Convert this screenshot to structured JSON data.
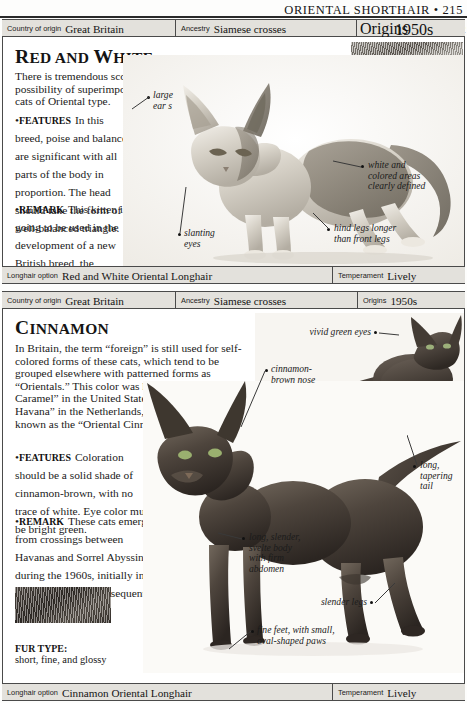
{
  "running_head": {
    "title": "ORIENTAL SHORTHAIR",
    "separator": "•",
    "page_number": "215",
    "full": "ORIENTAL SHORTHAIR • 215"
  },
  "entries": [
    {
      "id": "red-and-white",
      "title_first_letter": "R",
      "title_rest_1": "ED AND ",
      "title_letter_2": "W",
      "title_rest_2": "HITE",
      "title": "RED AND WHITE",
      "databar": {
        "country_label": "Country of origin",
        "country_value": "Great Britain",
        "ancestry_label": "Ancestry",
        "ancestry_value": "Siamese crosses",
        "origins_label": "Origins",
        "origins_value": "1950s"
      },
      "intro": "There is tremendous scope within the Oriental group, with the possibility of superimposing virtually any color or pattern onto cats of Oriental type.",
      "features_label": "FEATURES",
      "features_text": "In this breed, poise and balance are significant with all parts of the body in proportion. The head should take the form of a well-balanced triangle.",
      "remark_label": "REMARK",
      "remark_text": "This kitten is going to be used in the development of a new British breed, the Seychellois.",
      "fur_type_label": "FUR TYPE:",
      "fur_type_value": "short, fine, and glossy",
      "callouts": [
        {
          "name": "large-ears",
          "text": "large\near s"
        },
        {
          "name": "white-and-colored-areas",
          "text": "white and\ncolored areas\nclearly defined"
        },
        {
          "name": "slanting-eyes",
          "text": "slanting\neyes"
        },
        {
          "name": "hind-legs",
          "text": "hind legs longer\nthan front legs"
        }
      ],
      "footbar": {
        "longhair_label": "Longhair option",
        "longhair_value": "Red and White Oriental Longhair",
        "temperament_label": "Temperament",
        "temperament_value": "Lively"
      }
    },
    {
      "id": "cinnamon",
      "title_first_letter": "C",
      "title_rest_1": "INNAMON",
      "title": "CINNAMON",
      "databar": {
        "country_label": "Country of origin",
        "country_value": "Great Britain",
        "ancestry_label": "Ancestry",
        "ancestry_value": "Siamese crosses",
        "origins_label": "Origins",
        "origins_value": "1950s"
      },
      "intro": "In Britain, the term “foreign” is still used for self-colored forms of these cats, which tend to be grouped elsewhere with patterned forms as “Orientals.” This color was known as the “Oriental Caramel” in the United States, and as the “Blonde Havana” in the Netherlands, but is now generally known as the “Oriental Cinnamon.”",
      "features_label": "FEATURES",
      "features_text": "Coloration should be a solid shade of cinnamon-brown, with no trace of white. Eye color must be bright green.",
      "remark_label": "REMARK",
      "remark_text": "These cats emerged from crossings between Havanas and Sorrel Abyssinians during the 1960s, initially in the Netherlands, and subsequently in Great Britain.",
      "fur_type_label": "FUR TYPE:",
      "fur_type_value": "short, fine, and glossy",
      "callouts": [
        {
          "name": "vivid-green-eyes",
          "text": "vivid green eyes"
        },
        {
          "name": "cinnamon-brown-nose",
          "text": "cinnamon-\nbrown nose"
        },
        {
          "name": "long-tapering-tail",
          "text": "long,\ntapering\ntail"
        },
        {
          "name": "svelte-body",
          "text": "long, slender,\nsvelte body\nwith firm\nabdomen"
        },
        {
          "name": "slender-legs",
          "text": "slender legs"
        },
        {
          "name": "fine-feet",
          "text": "fine feet, with small,\noval-shaped paws"
        }
      ],
      "footbar": {
        "longhair_label": "Longhair option",
        "longhair_value": "Cinnamon Oriental Longhair",
        "temperament_label": "Temperament",
        "temperament_value": "Lively"
      }
    }
  ],
  "colors": {
    "rule": "#2a2a2a",
    "bar_fill": "#e3e1dc",
    "bar_border": "#4a4a4a",
    "text": "#141414"
  }
}
